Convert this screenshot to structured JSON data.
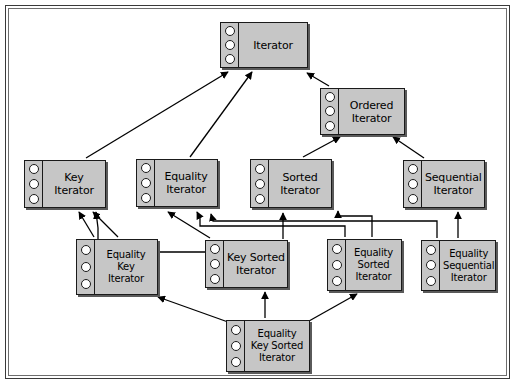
{
  "diagram": {
    "type": "uml-class-diagram",
    "background_color": "#ffffff",
    "node_fill_color": "#c6c6c6",
    "node_border_color": "#1a1a1a",
    "edge_color": "#000000",
    "frame_color": "#3a3a3a",
    "port_count_per_node": 3
  },
  "nodes": [
    {
      "id": "iterator",
      "lines": [
        "Iterator"
      ],
      "x": 220,
      "y": 22,
      "w": 88,
      "h": 46
    },
    {
      "id": "ordered-iterator",
      "lines": [
        "Ordered",
        "Iterator"
      ],
      "x": 320,
      "y": 88,
      "w": 85,
      "h": 47
    },
    {
      "id": "key-iterator",
      "lines": [
        "Key",
        "Iterator"
      ],
      "x": 24,
      "y": 160,
      "w": 82,
      "h": 48
    },
    {
      "id": "equality-iterator",
      "lines": [
        "Equality",
        "Iterator"
      ],
      "x": 136,
      "y": 159,
      "w": 82,
      "h": 48
    },
    {
      "id": "sorted-iterator",
      "lines": [
        "Sorted",
        "Iterator"
      ],
      "x": 250,
      "y": 159,
      "w": 82,
      "h": 49
    },
    {
      "id": "sequential-iterator",
      "lines": [
        "Sequential",
        "Iterator"
      ],
      "x": 403,
      "y": 160,
      "w": 82,
      "h": 48
    },
    {
      "id": "equality-key-iterator",
      "lines": [
        "Equality",
        "Key",
        "Iterator"
      ],
      "x": 76,
      "y": 239,
      "w": 82,
      "h": 56
    },
    {
      "id": "key-sorted-iterator",
      "lines": [
        "Key Sorted",
        "Iterator"
      ],
      "x": 205,
      "y": 240,
      "w": 83,
      "h": 48
    },
    {
      "id": "equality-sorted-iterator",
      "lines": [
        "Equality",
        "Sorted",
        "Iterator"
      ],
      "x": 327,
      "y": 239,
      "w": 75,
      "h": 52
    },
    {
      "id": "equality-sequential-iterator",
      "lines": [
        "Equality",
        "Sequential",
        "Iterator"
      ],
      "x": 421,
      "y": 240,
      "w": 75,
      "h": 51
    },
    {
      "id": "equality-key-sorted-iterator",
      "lines": [
        "Equality",
        "Key Sorted",
        "Iterator"
      ],
      "x": 226,
      "y": 320,
      "w": 84,
      "h": 52
    }
  ],
  "edges": [
    {
      "from": "key-iterator",
      "to": "iterator",
      "style": "diagonal"
    },
    {
      "from": "equality-iterator",
      "to": "iterator",
      "style": "diagonal"
    },
    {
      "from": "ordered-iterator",
      "to": "iterator",
      "style": "diagonal"
    },
    {
      "from": "sorted-iterator",
      "to": "ordered-iterator",
      "style": "diagonal"
    },
    {
      "from": "sequential-iterator",
      "to": "ordered-iterator",
      "style": "diagonal"
    },
    {
      "from": "equality-key-iterator",
      "to": "key-iterator",
      "style": "diagonal"
    },
    {
      "from": "equality-key-iterator",
      "to": "equality-iterator",
      "style": "diagonal"
    },
    {
      "from": "key-sorted-iterator",
      "to": "key-iterator",
      "style": "orthogonal"
    },
    {
      "from": "key-sorted-iterator",
      "to": "sorted-iterator",
      "style": "vertical"
    },
    {
      "from": "equality-sorted-iterator",
      "to": "equality-iterator",
      "style": "orthogonal"
    },
    {
      "from": "equality-sorted-iterator",
      "to": "sorted-iterator",
      "style": "orthogonal"
    },
    {
      "from": "equality-sequential-iterator",
      "to": "equality-iterator",
      "style": "orthogonal"
    },
    {
      "from": "equality-sequential-iterator",
      "to": "sequential-iterator",
      "style": "vertical"
    },
    {
      "from": "equality-key-sorted-iterator",
      "to": "equality-key-iterator",
      "style": "diagonal"
    },
    {
      "from": "equality-key-sorted-iterator",
      "to": "key-sorted-iterator",
      "style": "vertical"
    },
    {
      "from": "equality-key-sorted-iterator",
      "to": "equality-sorted-iterator",
      "style": "diagonal"
    }
  ]
}
